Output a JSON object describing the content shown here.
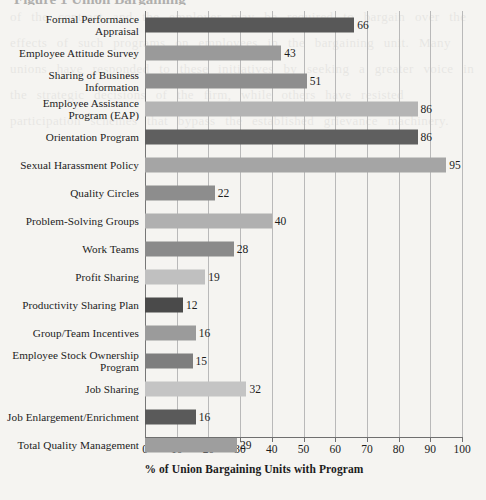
{
  "chart_data": {
    "type": "bar",
    "orientation": "horizontal",
    "title": "",
    "xlabel": "% of Union Bargaining Units with Program",
    "ylabel": "",
    "xlim": [
      0,
      100
    ],
    "xticks": [
      0,
      10,
      20,
      30,
      40,
      50,
      60,
      70,
      80,
      90,
      100
    ],
    "grid": true,
    "legend": "none",
    "categories": [
      "Formal Performance Appraisal",
      "Employee Attitude Survey",
      "Sharing of Business Information",
      "Employee Assistance Program (EAP)",
      "Orientation Program",
      "Sexual Harassment Policy",
      "Quality Circles",
      "Problem-Solving Groups",
      "Work Teams",
      "Profit Sharing",
      "Productivity Sharing Plan",
      "Group/Team Incentives",
      "Employee Stock Ownership Program",
      "Job Sharing",
      "Job Enlargement/Enrichment",
      "Total Quality Management"
    ],
    "values": [
      66,
      43,
      51,
      86,
      86,
      95,
      22,
      40,
      28,
      19,
      12,
      16,
      15,
      32,
      16,
      29
    ],
    "bar_colors": [
      "#585858",
      "#9a9a9a",
      "#8e8e8e",
      "#b4b4b4",
      "#5f5f5f",
      "#a5a5a5",
      "#8d8d8d",
      "#b0b0b0",
      "#8a8a8a",
      "#c0c0c0",
      "#4a4a4a",
      "#9b9b9b",
      "#7e7e7e",
      "#c4c4c4",
      "#5a5a5a",
      "#9e9e9e"
    ]
  },
  "rows": [
    {
      "label_lines": [
        "Formal Performance",
        "Appraisal"
      ],
      "value": 66,
      "color": "#585858"
    },
    {
      "label_lines": [
        "Employee Attitude Survey"
      ],
      "value": 43,
      "color": "#9a9a9a"
    },
    {
      "label_lines": [
        "Sharing of Business",
        "Information"
      ],
      "value": 51,
      "color": "#8e8e8e"
    },
    {
      "label_lines": [
        "Employee Assistance",
        "Program (EAP)"
      ],
      "value": 86,
      "color": "#b4b4b4"
    },
    {
      "label_lines": [
        "Orientation Program"
      ],
      "value": 86,
      "color": "#5f5f5f"
    },
    {
      "label_lines": [
        "Sexual Harassment Policy"
      ],
      "value": 95,
      "color": "#a5a5a5"
    },
    {
      "label_lines": [
        "Quality Circles"
      ],
      "value": 22,
      "color": "#8d8d8d"
    },
    {
      "label_lines": [
        "Problem-Solving Groups"
      ],
      "value": 40,
      "color": "#b0b0b0"
    },
    {
      "label_lines": [
        "Work Teams"
      ],
      "value": 28,
      "color": "#8a8a8a"
    },
    {
      "label_lines": [
        "Profit Sharing"
      ],
      "value": 19,
      "color": "#c0c0c0"
    },
    {
      "label_lines": [
        "Productivity Sharing Plan"
      ],
      "value": 12,
      "color": "#4a4a4a"
    },
    {
      "label_lines": [
        "Group/Team Incentives"
      ],
      "value": 16,
      "color": "#9b9b9b"
    },
    {
      "label_lines": [
        "Employee Stock Ownership",
        "Program"
      ],
      "value": 15,
      "color": "#7e7e7e"
    },
    {
      "label_lines": [
        "Job Sharing"
      ],
      "value": 32,
      "color": "#c4c4c4"
    },
    {
      "label_lines": [
        "Job Enlargement/Enrichment"
      ],
      "value": 16,
      "color": "#5a5a5a"
    },
    {
      "label_lines": [
        "Total Quality Management"
      ],
      "value": 29,
      "color": "#9e9e9e"
    }
  ],
  "axis": {
    "title": "% of Union Bargaining Units with Program",
    "ticks": [
      "0",
      "10",
      "20",
      "30",
      "40",
      "50",
      "60",
      "70",
      "80",
      "90",
      "100"
    ]
  },
  "scan_artifacts": {
    "top_cut_text": "Figure 1  Union Bargaining",
    "bleed_text": "of the contract and the employer may be required to bargain over the effects of such programs on employees in the bargaining unit. Many unions have responded to these initiatives by seeking a greater voice in the strategic decisions of the firm, while others have resisted participation schemes that bypass the established grievance machinery."
  }
}
